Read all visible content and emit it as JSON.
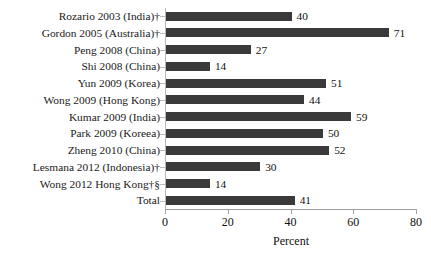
{
  "chart_data": {
    "type": "bar",
    "orientation": "horizontal",
    "title": "",
    "xlabel": "Percent",
    "ylabel": "",
    "xlim": [
      0,
      80
    ],
    "xticks": [
      0,
      20,
      40,
      60,
      80
    ],
    "grid": false,
    "legend": null,
    "categories": [
      "Rozario 2003 (India)†",
      "Gordon 2005 (Australia)†",
      "Peng 2008 (China)",
      "Shi 2008 (China)",
      "Yun 2009 (Korea)",
      "Wong 2009 (Hong Kong)",
      "Kumar 2009 (India)",
      "Park 2009 (Koreea)",
      "Zheng 2010 (China)",
      "Lesmana 2012 (Indonesia)†",
      "Wong 2012 Hong Kong†§",
      "Total"
    ],
    "values": [
      40,
      71,
      27,
      14,
      51,
      44,
      59,
      50,
      52,
      30,
      14,
      41
    ],
    "bar_color": "#3a3a3a",
    "axis_color": "#9e9e9e"
  }
}
